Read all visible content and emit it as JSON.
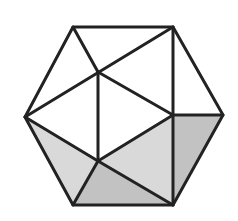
{
  "figure": {
    "colors": {
      "background": "#ffffff",
      "stroke": "#222222",
      "shade_light": "#d9d9d9",
      "shade_dark": "#c2c2c2"
    },
    "vertices": {
      "A": [
        73,
        27
      ],
      "B": [
        173,
        27
      ],
      "C": [
        223,
        115
      ],
      "D": [
        173,
        205
      ],
      "E": [
        73,
        205
      ],
      "F": [
        25,
        117
      ],
      "P": [
        98,
        72
      ],
      "Q": [
        98,
        161
      ],
      "R": [
        173,
        115
      ]
    },
    "shaded_regions": [
      {
        "name": "left-triangle",
        "points": "25,117 98,161 73,205",
        "tone": "light"
      },
      {
        "name": "bottom-triangle",
        "points": "98,161 73,205 173,205",
        "tone": "dark"
      },
      {
        "name": "center-right-triangle",
        "points": "98,161 173,115 173,205",
        "tone": "light"
      },
      {
        "name": "right-triangle",
        "points": "173,115 223,115 173,205",
        "tone": "dark"
      }
    ]
  }
}
